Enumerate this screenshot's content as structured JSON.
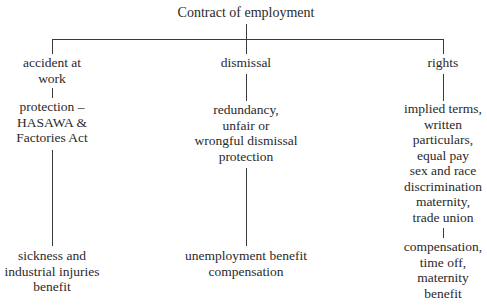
{
  "root": {
    "label": "Contract of employment"
  },
  "branches": [
    {
      "label_lines": [
        "accident at",
        "work"
      ],
      "level2_lines": [
        "protection –",
        "HASAWA &",
        "Factories Act"
      ],
      "level3_lines": [
        "sickness and",
        "industrial injuries",
        "benefit"
      ]
    },
    {
      "label_lines": [
        "dismissal"
      ],
      "level2_lines": [
        "redundancy,",
        "unfair or",
        "wrongful dismissal",
        "protection"
      ],
      "level3_lines": [
        "unemployment benefit",
        "compensation"
      ]
    },
    {
      "label_lines": [
        "rights"
      ],
      "level2_lines": [
        "implied terms,",
        "written",
        "particulars,",
        "equal pay",
        "sex and race",
        "discrimination",
        "maternity,",
        "trade union"
      ],
      "level3_lines": [
        "compensation,",
        "time off,",
        "maternity",
        "benefit"
      ]
    }
  ]
}
